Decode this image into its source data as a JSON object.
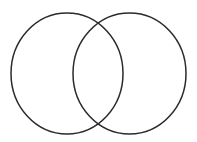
{
  "figure": {
    "type": "venn-diagram",
    "background_color": "#ffffff",
    "canvas": {
      "width": 197,
      "height": 142
    }
  },
  "style": {
    "stroke_color": "#2b2b2b",
    "stroke_width": 1.5,
    "fill": "none"
  },
  "shapes": [
    {
      "name": "left-circle",
      "label": "",
      "cx": 67,
      "cy": 73.5,
      "rx": 56,
      "ry": 60.5
    },
    {
      "name": "right-circle",
      "label": "",
      "cx": 129.5,
      "cy": 73.5,
      "rx": 56.5,
      "ry": 60.5
    }
  ],
  "intersection": {
    "name": "overlap-lens",
    "label": "",
    "upper_point": {
      "x": 98,
      "y": 17
    },
    "lower_point": {
      "x": 98,
      "y": 127
    }
  },
  "labels": []
}
